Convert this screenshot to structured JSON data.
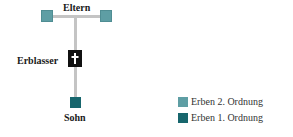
{
  "diagram": {
    "nodes": {
      "parents_label": "Eltern",
      "decedent_label": "Erblasser",
      "son_label": "Sohn"
    },
    "legend": [
      {
        "label": "Erben 2. Ordnung",
        "color": "#5e9ea4"
      },
      {
        "label": "Erben 1. Ordnung",
        "color": "#17666d"
      }
    ],
    "colors": {
      "second_order": "#5e9ea4",
      "first_order": "#17666d",
      "decedent": "#111111",
      "connector": "#c4c4c4"
    },
    "icons": {
      "decedent_marker": "cross-icon"
    }
  }
}
